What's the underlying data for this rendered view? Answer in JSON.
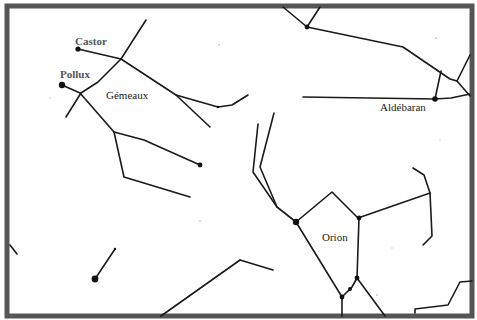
{
  "colors": {
    "frame": "#555555",
    "lines": "#1a1a1a",
    "stars": "#111111",
    "background": "#ffffff"
  },
  "labels": {
    "castor": "Castor",
    "pollux": "Pollux",
    "gemeaux": "Gémeaux",
    "aldebaran": "Aldébaran",
    "orion": "Orion"
  },
  "constellations": [
    {
      "name": "Gémeaux",
      "stars": [
        "Castor",
        "Pollux"
      ]
    },
    {
      "name": "Orion",
      "stars": []
    },
    {
      "name": "Taureau",
      "stars": [
        "Aldébaran"
      ]
    }
  ]
}
